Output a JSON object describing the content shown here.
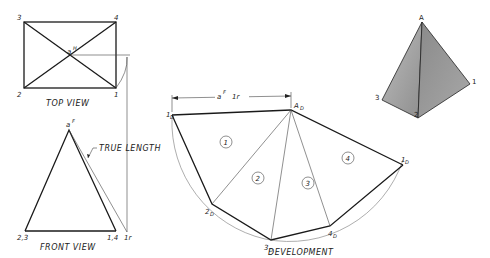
{
  "top_view": {
    "caption": "TOP VIEW",
    "points": {
      "p3": "3",
      "p4": "4",
      "p2": "2",
      "p1": "1",
      "apex": "a",
      "apex_sup": "H"
    }
  },
  "front_view": {
    "caption": "FRONT VIEW",
    "apex": "a",
    "apex_sup": "F",
    "left_base": "2,3",
    "right_base": "1,4",
    "rotated": "1r",
    "annotation": "TRUE LENGTH"
  },
  "development": {
    "caption": "DEVELOPMENT",
    "dimension": {
      "a": "a",
      "sup": "F",
      "sub": "1r"
    },
    "points": {
      "A": {
        "main": "A",
        "sub": "D"
      },
      "p1_start": {
        "main": "1",
        "sub": "D"
      },
      "p2": {
        "main": "2",
        "sub": "D"
      },
      "p3": {
        "main": "3",
        "sub": "D"
      },
      "p4": {
        "main": "4",
        "sub": "D"
      },
      "p1_end": {
        "main": "1",
        "sub": "D"
      }
    },
    "faces": [
      "1",
      "2",
      "3",
      "4"
    ]
  },
  "pictorial": {
    "apex": "A",
    "p1": "1",
    "p2": "2",
    "p3": "3"
  }
}
